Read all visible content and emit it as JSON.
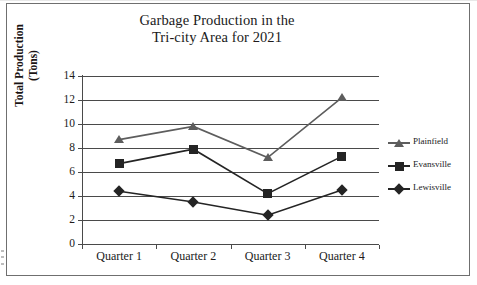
{
  "chart_data": {
    "type": "line",
    "title": "Garbage Production in the Tri-city Area for 2021",
    "title_line1": "Garbage Production in the",
    "title_line2": "Tri-city Area for 2021",
    "xlabel": "",
    "ylabel": "Total Production (Tons)",
    "ylabel_line1": "Total Production",
    "ylabel_line2": "(Tons)",
    "categories": [
      "Quarter 1",
      "Quarter 2",
      "Quarter 3",
      "Quarter 4"
    ],
    "ylim": [
      0,
      14
    ],
    "yticks": [
      0,
      2,
      4,
      6,
      8,
      10,
      12,
      14
    ],
    "ytick_labels": [
      "0",
      "2",
      "4",
      "6",
      "8",
      "10",
      "12",
      "14"
    ],
    "grid": true,
    "grid_axis": "y",
    "legend_position": "right",
    "series": [
      {
        "name": "Plainfield",
        "marker": "triangle",
        "color": "#5d5d5d",
        "values": [
          8.7,
          9.8,
          7.2,
          12.2
        ]
      },
      {
        "name": "Evansville",
        "marker": "square",
        "color": "#242424",
        "values": [
          6.7,
          7.9,
          4.2,
          7.3
        ]
      },
      {
        "name": "Lewisville",
        "marker": "diamond",
        "color": "#242424",
        "values": [
          4.4,
          3.5,
          2.4,
          4.5
        ]
      }
    ]
  },
  "figure": {
    "border_color": "#6f6f6f",
    "grid_color": "#4a4a4a",
    "background": "#ffffff",
    "text_color": "#201a1a"
  }
}
